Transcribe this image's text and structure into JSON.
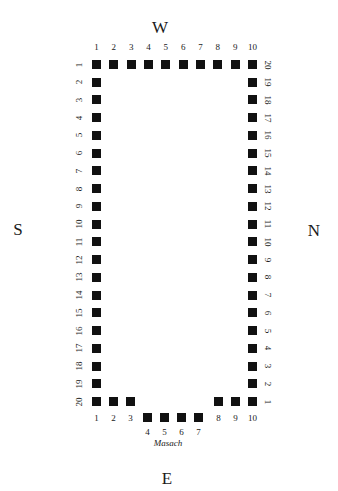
{
  "compass": {
    "west": "W",
    "south": "S",
    "north": "N",
    "east": "E"
  },
  "caption": "Masach",
  "top_row": {
    "side": "W",
    "labels": [
      "1",
      "2",
      "3",
      "4",
      "5",
      "6",
      "7",
      "8",
      "9",
      "10"
    ]
  },
  "left_column": {
    "side": "S",
    "labels": [
      "1",
      "2",
      "3",
      "4",
      "5",
      "6",
      "7",
      "8",
      "9",
      "10",
      "11",
      "12",
      "13",
      "14",
      "15",
      "16",
      "17",
      "18",
      "19",
      "20"
    ]
  },
  "right_column": {
    "side": "N",
    "labels_top_to_bottom": [
      "20",
      "19",
      "18",
      "17",
      "16",
      "15",
      "14",
      "13",
      "12",
      "11",
      "10",
      "9",
      "8",
      "7",
      "6",
      "5",
      "4",
      "3",
      "2",
      "1"
    ]
  },
  "bottom_row": {
    "side": "E",
    "labels": [
      "1",
      "2",
      "3",
      "4",
      "5",
      "6",
      "7",
      "8",
      "9",
      "10"
    ],
    "recessed_indices": [
      4,
      5,
      6,
      7
    ]
  }
}
